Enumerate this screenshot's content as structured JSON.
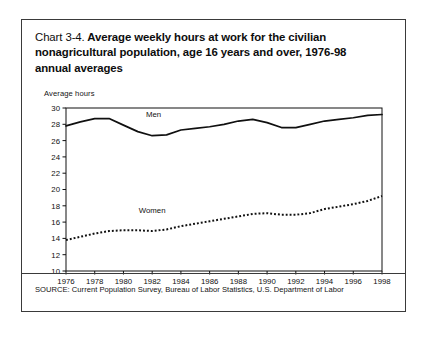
{
  "figure": {
    "title_number": "Chart 3-4.",
    "title_text": "Average weekly hours at work for the civilian nonagricultural population, age 16 years and over, 1976-98 annual averages",
    "y_axis_title": "Average hours",
    "source_note": "SOURCE: Current Population Survey, Bureau of Labor Statistics, U.S. Department of Labor",
    "border_color": "#3a3a3a",
    "background_color": "#ffffff",
    "ink_color": "#101010"
  },
  "chart_data": {
    "type": "line",
    "title": "Chart 3-4. Average weekly hours at work for the civilian nonagricultural population, age 16 years and over, 1976-98 annual averages",
    "xlabel": "",
    "ylabel": "Average hours",
    "xlim": [
      1976,
      1998
    ],
    "ylim": [
      10,
      30
    ],
    "ytick_step": 2,
    "xtick_step": 2,
    "grid": false,
    "legend_position": "inline-labels",
    "yticks": [
      10,
      12,
      14,
      16,
      18,
      20,
      22,
      24,
      26,
      28,
      30
    ],
    "xticks": [
      1976,
      1978,
      1980,
      1982,
      1984,
      1986,
      1988,
      1990,
      1992,
      1994,
      1996,
      1998
    ],
    "x": [
      1976,
      1977,
      1978,
      1979,
      1980,
      1981,
      1982,
      1983,
      1984,
      1985,
      1986,
      1987,
      1988,
      1989,
      1990,
      1991,
      1992,
      1993,
      1994,
      1995,
      1996,
      1997,
      1998
    ],
    "series": [
      {
        "name": "Men",
        "style": "solid",
        "color": "#101010",
        "label_x": 1982.1,
        "label_y": 28.9,
        "values": [
          27.8,
          28.3,
          28.7,
          28.7,
          27.9,
          27.1,
          26.6,
          26.7,
          27.3,
          27.5,
          27.7,
          28.0,
          28.4,
          28.6,
          28.2,
          27.6,
          27.6,
          28.0,
          28.4,
          28.6,
          28.8,
          29.1,
          29.2
        ]
      },
      {
        "name": "Women",
        "style": "dotted",
        "color": "#101010",
        "label_x": 1982.0,
        "label_y": 17.1,
        "values": [
          13.8,
          14.2,
          14.6,
          14.9,
          15.0,
          15.0,
          14.9,
          15.1,
          15.5,
          15.8,
          16.1,
          16.4,
          16.7,
          17.0,
          17.1,
          16.9,
          16.9,
          17.1,
          17.6,
          17.9,
          18.2,
          18.6,
          19.2
        ]
      }
    ]
  }
}
